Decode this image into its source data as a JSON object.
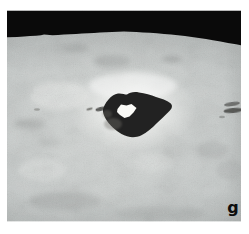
{
  "figure": {
    "panel_label": "g",
    "type": "photograph",
    "colors": {
      "page_background": "#ffffff",
      "sky": "#0a0a0a",
      "terrain": "#cbcfce",
      "terrain_bright": "#eceeec",
      "crater_floor": "#232321",
      "central_peak": "#fbfbf8",
      "label": "#0d0d0d"
    }
  }
}
